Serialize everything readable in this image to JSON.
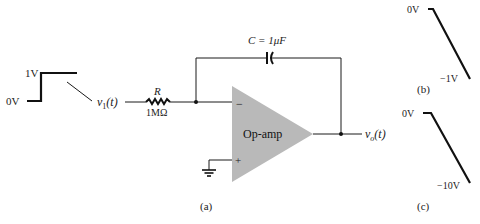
{
  "figure": {
    "caption_a": "(a)",
    "caption_b": "(b)",
    "caption_c": "(c)"
  },
  "input_waveform": {
    "high_label": "1V",
    "low_label": "0V",
    "signal_name": "v",
    "signal_sub": "1",
    "signal_arg": "(t)"
  },
  "resistor": {
    "name": "R",
    "value": "1MΩ"
  },
  "capacitor": {
    "label": "C = 1μF"
  },
  "opamp": {
    "label": "Op-amp",
    "inverting": "−",
    "noninverting": "+"
  },
  "output": {
    "signal_name": "v",
    "signal_sub": "o",
    "signal_arg": "(t)"
  },
  "output_waveform_b": {
    "start_label": "0V",
    "end_label": "−1V"
  },
  "output_waveform_c": {
    "start_label": "0V",
    "end_label": "−10V"
  },
  "colors": {
    "opamp_fill": "#b9b9b9",
    "line": "#1a1a1a"
  }
}
